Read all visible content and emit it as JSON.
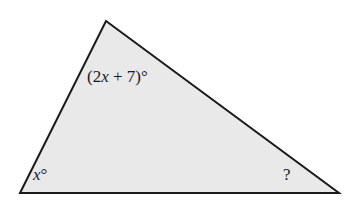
{
  "figure": {
    "kind": "triangle-angle-diagram",
    "background_color": "#ffffff",
    "fill_color": "#e9e9e9",
    "stroke_color": "#1a1a1a",
    "stroke_width": 2,
    "vertices": {
      "apex": [
        106,
        21
      ],
      "bottom_left": [
        20,
        193
      ],
      "bottom_right": [
        339,
        193
      ]
    },
    "labels": {
      "apex_angle": {
        "full_text": "(2x + 7)°",
        "prefix": "(2",
        "variable": "x",
        "suffix": " + 7)°"
      },
      "bottom_left_angle": {
        "full_text": "x°",
        "variable": "x",
        "suffix": "°"
      },
      "bottom_right_angle": {
        "full_text": "?"
      }
    }
  }
}
